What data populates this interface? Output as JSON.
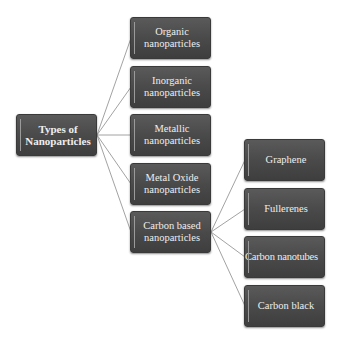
{
  "diagram": {
    "type": "hierarchy",
    "root": {
      "label": "Types of\nNanoparticles"
    },
    "level1": [
      {
        "label": "Organic\nnanoparticles"
      },
      {
        "label": "Inorganic\nnanoparticles"
      },
      {
        "label": "Metallic\nnanoparticles"
      },
      {
        "label": "Metal Oxide\nnanoparticles"
      },
      {
        "label": "Carbon based\nnanoparticles"
      }
    ],
    "level2_parent": "Carbon based nanoparticles",
    "level2": [
      {
        "label": "Graphene"
      },
      {
        "label": "Fullerenes"
      },
      {
        "label": "Carbon nanotubes"
      },
      {
        "label": "Carbon black"
      }
    ]
  },
  "colors": {
    "node_fill": "#4a4a4a",
    "node_text": "#eeeeee",
    "connector": "#8a8a8a",
    "background": "#ffffff"
  }
}
